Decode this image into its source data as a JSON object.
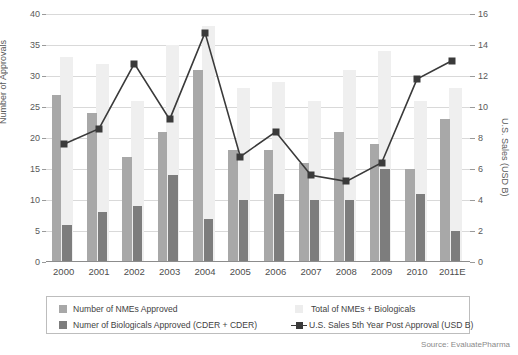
{
  "chart_data": {
    "type": "bar",
    "title": "",
    "xlabel": "",
    "ylabel": "Number of Approvals",
    "ylabel_secondary": "U.S. Sales (USD B)",
    "ylim": [
      0,
      40
    ],
    "ylim_secondary": [
      0,
      16
    ],
    "yticks": [
      0,
      5,
      10,
      15,
      20,
      25,
      30,
      35,
      40
    ],
    "yticks_secondary": [
      0,
      2,
      4,
      6,
      8,
      10,
      12,
      14,
      16
    ],
    "grid": true,
    "legend_position": "bottom",
    "categories": [
      "2000",
      "2001",
      "2002",
      "2003",
      "2004",
      "2005",
      "2006",
      "2007",
      "2008",
      "2009",
      "2010",
      "2011E"
    ],
    "series": [
      {
        "name": "Total of NMEs + Biologicals",
        "key": "total",
        "type": "bar",
        "axis": "left",
        "color": "#efefef",
        "values": [
          33,
          32,
          26,
          35,
          38,
          28,
          29,
          26,
          31,
          34,
          26,
          28
        ]
      },
      {
        "name": "Number of NMEs Approved",
        "key": "nme",
        "type": "bar",
        "axis": "left",
        "color": "#a8a8a8",
        "values": [
          27,
          24,
          17,
          21,
          31,
          18,
          18,
          16,
          21,
          19,
          15,
          23
        ]
      },
      {
        "name": "Numer of Biologicals Approved (CDER + CDER)",
        "key": "bio",
        "type": "bar",
        "axis": "left",
        "color": "#7d7d7d",
        "values": [
          6,
          8,
          9,
          14,
          7,
          10,
          11,
          10,
          10,
          15,
          11,
          5
        ]
      },
      {
        "name": "U.S. Sales 5th Year Post Approval (USD B)",
        "key": "sales",
        "type": "line",
        "axis": "right",
        "color": "#3a3a3a",
        "values": [
          7.6,
          8.6,
          12.8,
          9.2,
          14.8,
          6.8,
          8.4,
          5.6,
          5.2,
          6.4,
          11.8,
          13.0
        ]
      }
    ]
  },
  "legend": {
    "items": [
      {
        "label": "Number of NMEs Approved",
        "marker": "swatch-light-gray"
      },
      {
        "label": "Numer of Biologicals Approved (CDER + CDER)",
        "marker": "swatch-dark-gray"
      },
      {
        "label": "Total of NMEs + Biologicals",
        "marker": "swatch-pale-gray"
      },
      {
        "label": "U.S. Sales 5th Year Post Approval (USD B)",
        "marker": "line-square-marker"
      }
    ]
  },
  "source": {
    "text": "Source: EvaluatePharma"
  },
  "colors": {
    "bar_total": "#efefef",
    "bar_nme": "#a8a8a8",
    "bar_bio": "#7d7d7d",
    "line": "#3a3a3a",
    "grid": "#d9d9d9",
    "text": "#4a4a4a"
  }
}
